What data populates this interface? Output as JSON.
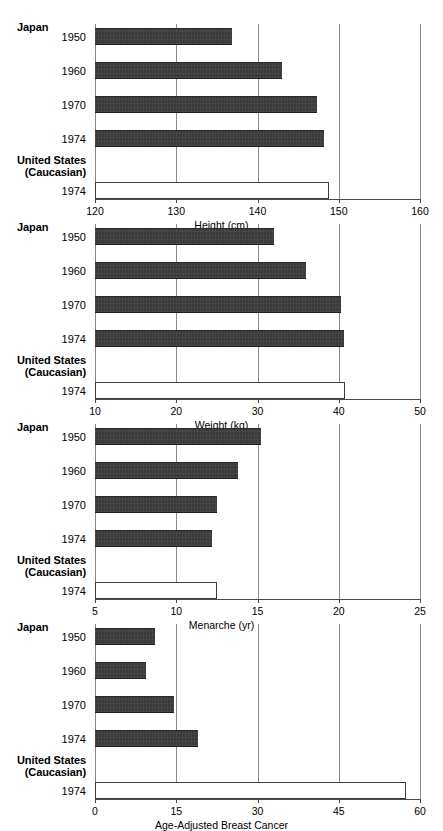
{
  "figure": {
    "group_japan": "Japan",
    "group_us_line1": "United States",
    "group_us_line2": "(Caucasian)",
    "years_japan": [
      "1950",
      "1960",
      "1970",
      "1974"
    ],
    "year_us": "1974"
  },
  "chart_data": [
    {
      "type": "bar",
      "orientation": "horizontal",
      "title": "",
      "xlabel": "Height (cm)",
      "ylabel": "",
      "xlim": [
        120,
        160
      ],
      "xticks": [
        120,
        130,
        140,
        150,
        160
      ],
      "xticklabels": [
        "120",
        "130",
        "140",
        "150",
        "160"
      ],
      "grid": true,
      "categories": [
        "Japan 1950",
        "Japan 1960",
        "Japan 1970",
        "Japan 1974",
        "United States (Caucasian) 1974"
      ],
      "values": [
        136.8,
        143.0,
        147.3,
        148.2,
        148.8
      ],
      "styles": [
        "filled",
        "filled",
        "filled",
        "filled",
        "open"
      ]
    },
    {
      "type": "bar",
      "orientation": "horizontal",
      "title": "",
      "xlabel": "Weight (kg)",
      "ylabel": "",
      "xlim": [
        10,
        50
      ],
      "xticks": [
        10,
        20,
        30,
        40,
        50
      ],
      "xticklabels": [
        "10",
        "20",
        "30",
        "40",
        "50"
      ],
      "grid": true,
      "categories": [
        "Japan 1950",
        "Japan 1960",
        "Japan 1970",
        "Japan 1974",
        "United States (Caucasian) 1974"
      ],
      "values": [
        32.0,
        36.0,
        40.3,
        40.7,
        40.8
      ],
      "styles": [
        "filled",
        "filled",
        "filled",
        "filled",
        "open"
      ]
    },
    {
      "type": "bar",
      "orientation": "horizontal",
      "title": "",
      "xlabel": "Menarche (yr)",
      "ylabel": "",
      "xlim": [
        5,
        25
      ],
      "xticks": [
        5,
        10,
        15,
        20,
        25
      ],
      "xticklabels": [
        "5",
        "10",
        "15",
        "20",
        "25"
      ],
      "grid": true,
      "categories": [
        "Japan 1950",
        "Japan 1960",
        "Japan 1970",
        "Japan 1974",
        "United States (Caucasian) 1974"
      ],
      "values": [
        15.2,
        13.8,
        12.5,
        12.2,
        12.5
      ],
      "styles": [
        "filled",
        "filled",
        "filled",
        "filled",
        "open"
      ]
    },
    {
      "type": "bar",
      "orientation": "horizontal",
      "title": "",
      "xlabel": "Age-Adjusted Breast Cancer",
      "xlabel_line2": "Incidence/100,000/yr (age 50–54)",
      "ylabel": "",
      "xlim": [
        0,
        60
      ],
      "xticks": [
        0,
        15,
        30,
        45,
        60
      ],
      "xticklabels": [
        "0",
        "15",
        "30",
        "45",
        "60"
      ],
      "grid": true,
      "categories": [
        "Japan 1950",
        "Japan 1960",
        "Japan 1970",
        "Japan 1974",
        "United States (Caucasian) 1974"
      ],
      "values": [
        11.0,
        9.5,
        14.5,
        19.0,
        57.5
      ],
      "styles": [
        "filled",
        "filled",
        "filled",
        "filled",
        "open"
      ]
    }
  ],
  "colors": {
    "bar_fill": "#3a3a3a",
    "bar_open_fill": "#ffffff",
    "gridline": "#8a8a8a",
    "axis": "#4a4a4a",
    "background": "#ffffff",
    "text": "#000000"
  }
}
